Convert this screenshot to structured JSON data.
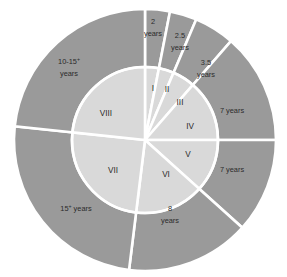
{
  "chart_data": {
    "type": "pie",
    "title": "",
    "subtitle": "",
    "xlabel": "",
    "ylabel": "",
    "legend_position": "none",
    "grid": false,
    "geometry": {
      "center_x": 145,
      "center_y": 140,
      "outer_radius": 131,
      "inner_radius": 73,
      "divider_color": "#ffffff"
    },
    "colors": {
      "outer_ring": "#9a9a9a",
      "inner_circle": "#d9d9d9",
      "divider": "#ffffff",
      "text": "#2b2b2b",
      "background": "#ffffff"
    },
    "categories": [
      "I",
      "II",
      "III",
      "IV",
      "V",
      "VI",
      "VII",
      "VIII"
    ],
    "outer_labels": [
      "2 years",
      "2.5 years",
      "3.5 years",
      "7 years",
      "7 years",
      "8 years",
      "15+ years",
      "10-15+ years"
    ],
    "slices": [
      {
        "id": "I",
        "inner_label": "I",
        "outer_label_line1": "2",
        "outer_label_line2": "years",
        "outer_label_sup": "",
        "outer_label": "2 years",
        "start_angle": -90,
        "end_angle": -79,
        "value": 11,
        "inner_label_x": 153,
        "inner_label_y": 91,
        "outer_label_x": 153,
        "outer_label_y": 24,
        "outer_label_y2": 36
      },
      {
        "id": "II",
        "inner_label": "II",
        "outer_label_line1": "2.5",
        "outer_label_line2": "years",
        "outer_label_sup": "",
        "outer_label": "2.5 years",
        "start_angle": -79,
        "end_angle": -67,
        "value": 12,
        "inner_label_x": 167,
        "inner_label_y": 92,
        "outer_label_x": 180,
        "outer_label_y": 38,
        "outer_label_y2": 50
      },
      {
        "id": "III",
        "inner_label": "III",
        "outer_label_line1": "3.5",
        "outer_label_line2": "years",
        "outer_label_sup": "",
        "outer_label": "3.5 years",
        "start_angle": -67,
        "end_angle": -49,
        "value": 18,
        "inner_label_x": 180,
        "inner_label_y": 105,
        "outer_label_x": 206,
        "outer_label_y": 65,
        "outer_label_y2": 77
      },
      {
        "id": "IV",
        "inner_label": "IV",
        "outer_label_line1": "7 years",
        "outer_label_line2": "",
        "outer_label_sup": "",
        "outer_label": "7 years",
        "start_angle": -49,
        "end_angle": 0,
        "value": 49,
        "inner_label_x": 190,
        "inner_label_y": 129,
        "outer_label_x": 232,
        "outer_label_y": 113,
        "outer_label_y2": 0
      },
      {
        "id": "V",
        "inner_label": "V",
        "outer_label_line1": "7 years",
        "outer_label_line2": "",
        "outer_label_sup": "",
        "outer_label": "7 years",
        "start_angle": 0,
        "end_angle": 42,
        "value": 42,
        "inner_label_x": 188,
        "inner_label_y": 157,
        "outer_label_x": 232,
        "outer_label_y": 172,
        "outer_label_y2": 0
      },
      {
        "id": "VI",
        "inner_label": "VI",
        "outer_label_line1": "8",
        "outer_label_line2": "years",
        "outer_label_sup": "",
        "outer_label": "8 years",
        "start_angle": 42,
        "end_angle": 97,
        "value": 55,
        "inner_label_x": 166,
        "inner_label_y": 177,
        "outer_label_x": 170,
        "outer_label_y": 211,
        "outer_label_y2": 223
      },
      {
        "id": "VII",
        "inner_label": "VII",
        "outer_label_line1": "15",
        "outer_label_line2": " years",
        "outer_label_sup": "+",
        "outer_label": "15+ years",
        "start_angle": 97,
        "end_angle": 186,
        "value": 89,
        "inner_label_x": 113,
        "inner_label_y": 173,
        "outer_label_x": 76,
        "outer_label_y": 211,
        "outer_label_y2": 0
      },
      {
        "id": "VIII",
        "inner_label": "VIII",
        "outer_label_line1": "10-15",
        "outer_label_line2": "years",
        "outer_label_sup": "+",
        "outer_label": "10-15+ years",
        "start_angle": 186,
        "end_angle": 270,
        "value": 84,
        "inner_label_x": 106,
        "inner_label_y": 116,
        "outer_label_x": 69,
        "outer_label_y": 64,
        "outer_label_y2": 76
      }
    ]
  }
}
